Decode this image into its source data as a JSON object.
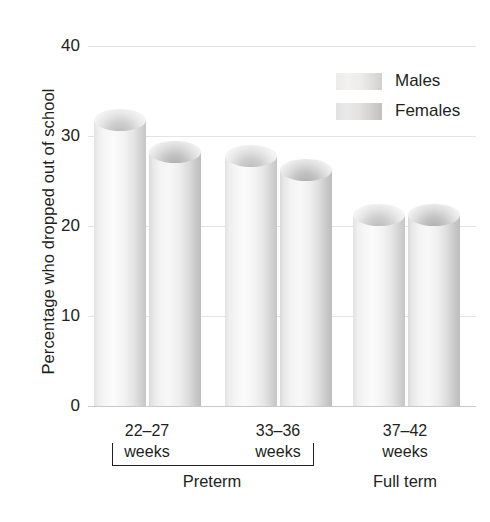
{
  "chart_data": {
    "type": "bar",
    "title": "",
    "xlabel": "",
    "ylabel": "Percentage who dropped out of school",
    "ylim": [
      0,
      40
    ],
    "yticks": [
      0,
      10,
      20,
      30,
      40
    ],
    "grid": true,
    "legend_position": "top-right",
    "categories": [
      "22–27 weeks",
      "33–36 weeks",
      "37–42 weeks"
    ],
    "category_lines": [
      [
        "22–27",
        "weeks"
      ],
      [
        "33–36",
        "weeks"
      ],
      [
        "37–42",
        "weeks"
      ]
    ],
    "group_labels": [
      "Preterm",
      "Full term"
    ],
    "series": [
      {
        "name": "Males",
        "values": [
          33.0,
          29.0,
          22.5
        ]
      },
      {
        "name": "Females",
        "values": [
          29.5,
          27.5,
          22.5
        ]
      }
    ]
  },
  "axis": {
    "y_title": "Percentage who dropped out of school",
    "y_ticks": [
      "40",
      "30",
      "20",
      "10",
      "0"
    ]
  },
  "legend": {
    "items": [
      {
        "label": "Males",
        "key": "male"
      },
      {
        "label": "Females",
        "key": "female"
      }
    ]
  },
  "x_axis": {
    "groups": [
      {
        "line1": "22–27",
        "line2": "weeks"
      },
      {
        "line1": "33–36",
        "line2": "weeks"
      },
      {
        "line1": "37–42",
        "line2": "weeks"
      }
    ],
    "super_groups": [
      {
        "label": "Preterm"
      },
      {
        "label": "Full term"
      }
    ]
  },
  "colors": {
    "text": "#231f20",
    "gridline": "#e3e3e5",
    "baseline": "#c9c9cc",
    "male_bar": "#f3f3f3",
    "female_bar": "#e4e4e4"
  }
}
